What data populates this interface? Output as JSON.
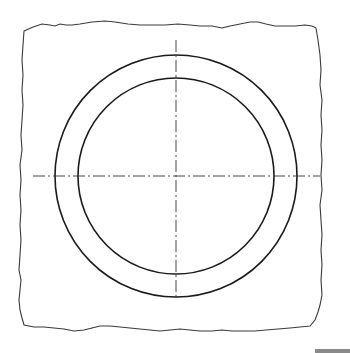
{
  "figure": {
    "type": "technical-drawing",
    "colors": {
      "background": "#ffffff",
      "stroke": "#1a1a1a",
      "break_line": "#3a3a3a",
      "center_line": "#333333",
      "corner_bar": "#8a8a8a"
    },
    "center": {
      "x": 176,
      "y": 176
    },
    "outer_circle_radius": 121,
    "inner_circle_radius": 98,
    "center_lines": {
      "horizontal": {
        "x1": 33,
        "x2": 320,
        "y": 176
      },
      "vertical": {
        "x": 176,
        "y1": 40,
        "y2": 300
      }
    }
  }
}
